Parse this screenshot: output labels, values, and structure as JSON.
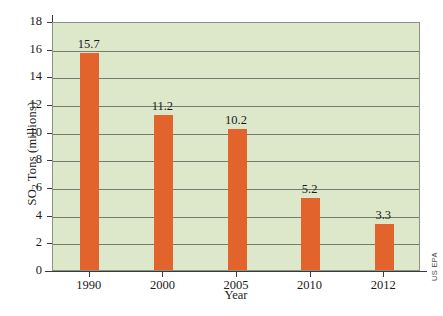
{
  "chart_data": {
    "type": "bar",
    "title": "",
    "xlabel": "Year",
    "ylabel": "SO2 Tons (millions)",
    "ylabel_prefix": "SO",
    "ylabel_sub": "2",
    "ylabel_suffix": " Tons (millions)",
    "categories": [
      "1990",
      "2000",
      "2005",
      "2010",
      "2012"
    ],
    "values": [
      15.7,
      11.2,
      10.2,
      5.2,
      3.3
    ],
    "value_labels": [
      "15.7",
      "11.2",
      "10.2",
      "5.2",
      "3.3"
    ],
    "ylim": [
      0,
      18
    ],
    "ytick_step": 2,
    "yticks": [
      "0",
      "2",
      "4",
      "6",
      "8",
      "10",
      "12",
      "14",
      "16",
      "18"
    ],
    "grid": true,
    "grid_axis": "y",
    "legend": null,
    "bar_color": "#e2632c",
    "plot_background": "#dde8cb",
    "gridline_color": "#767b6d",
    "axis_color": "#3a3a3a",
    "source": "US EPA"
  }
}
